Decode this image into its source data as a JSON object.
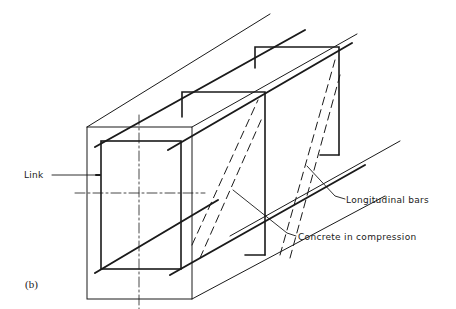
{
  "figure": {
    "caption": "(b)"
  },
  "labels": {
    "link": "Link",
    "longitudinal_bars": "Longitudinal bars",
    "concrete_in_compression": "Concrete in compression"
  },
  "colors": {
    "line": "#1a1a1a",
    "background": "#ffffff"
  }
}
